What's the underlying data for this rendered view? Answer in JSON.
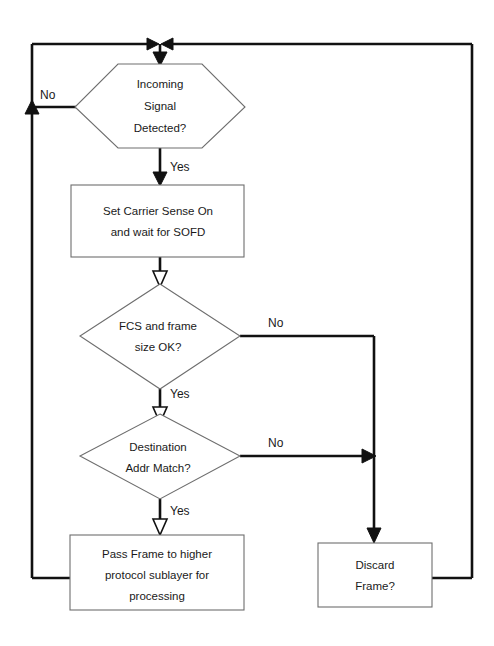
{
  "diagram": {
    "background_color": "#ffffff",
    "line_color": "#111111",
    "shape_stroke_color": "#6e6e6e",
    "text_color": "#1a1a1a"
  },
  "nodes": {
    "incoming_signal": {
      "shape": "hexagon",
      "line1": "Incoming",
      "line2": "Signal",
      "line3": "Detected?"
    },
    "set_carrier": {
      "shape": "process",
      "line1": "Set Carrier Sense On",
      "line2": "and wait for SOFD"
    },
    "fcs_check": {
      "shape": "diamond",
      "line1": "FCS and frame",
      "line2": "size OK?"
    },
    "dest_addr": {
      "shape": "diamond",
      "line1": "Destination",
      "line2": "Addr Match?"
    },
    "pass_frame": {
      "shape": "process",
      "line1": "Pass Frame to higher",
      "line2": "protocol sublayer for",
      "line3": "processing"
    },
    "discard_frame": {
      "shape": "process",
      "line1": "Discard",
      "line2": "Frame?"
    }
  },
  "edge_labels": {
    "signal_no": "No",
    "signal_yes": "Yes",
    "fcs_no": "No",
    "fcs_yes": "Yes",
    "dest_no": "No",
    "dest_yes": "Yes"
  }
}
